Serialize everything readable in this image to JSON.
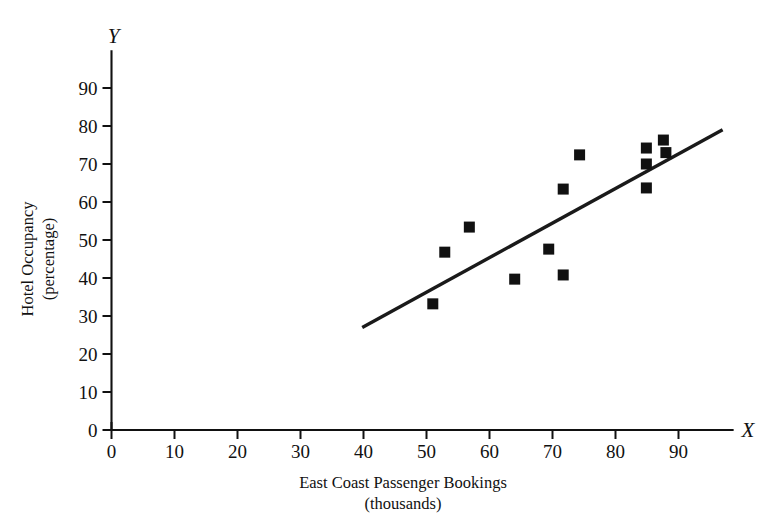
{
  "chart_data": {
    "type": "scatter",
    "title": "",
    "xlabel": "East Coast Passenger Bookings",
    "xlabel_sub": "(thousands)",
    "ylabel": "Hotel Occupancy",
    "ylabel_sub": "(percentage)",
    "x_axis_letter": "X",
    "y_axis_letter": "Y",
    "xlim": [
      0,
      97
    ],
    "ylim": [
      0,
      97
    ],
    "xticks": [
      0,
      10,
      20,
      30,
      40,
      50,
      60,
      70,
      80,
      90
    ],
    "yticks": [
      0,
      10,
      20,
      30,
      40,
      50,
      60,
      70,
      80,
      90
    ],
    "xtick_labels": [
      "0",
      "10",
      "20",
      "30",
      "40",
      "50",
      "60",
      "70",
      "80",
      "90"
    ],
    "ytick_labels": [
      "0",
      "10",
      "20",
      "30",
      "40",
      "50",
      "60",
      "70",
      "80",
      "90"
    ],
    "grid": false,
    "legend": false,
    "marker": "square",
    "marker_color": "#111111",
    "line_color": "#1a1a1a",
    "points": [
      {
        "x": 51.0,
        "y": 33.2
      },
      {
        "x": 52.9,
        "y": 46.8
      },
      {
        "x": 56.8,
        "y": 53.4
      },
      {
        "x": 64.0,
        "y": 39.7
      },
      {
        "x": 69.4,
        "y": 47.6
      },
      {
        "x": 71.7,
        "y": 40.8
      },
      {
        "x": 71.7,
        "y": 63.4
      },
      {
        "x": 74.3,
        "y": 72.4
      },
      {
        "x": 84.9,
        "y": 63.7
      },
      {
        "x": 84.9,
        "y": 70.0
      },
      {
        "x": 84.9,
        "y": 74.2
      },
      {
        "x": 87.6,
        "y": 76.3
      },
      {
        "x": 88.0,
        "y": 73.0
      }
    ],
    "trend_line": {
      "x1": 39.8,
      "y1": 27.0,
      "x2": 97.0,
      "y2": 79.0
    }
  }
}
